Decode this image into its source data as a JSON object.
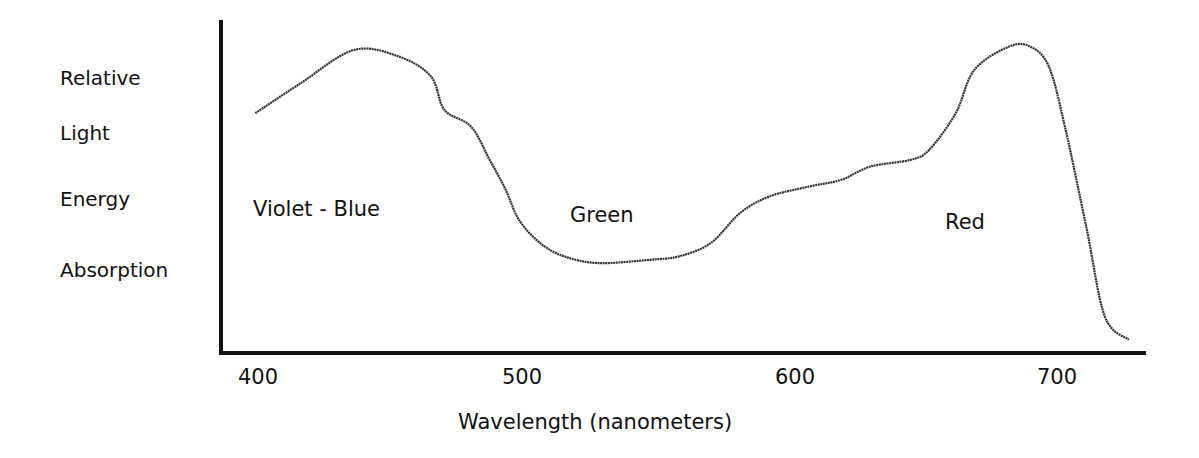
{
  "chart_data": {
    "type": "line",
    "title": "",
    "xlabel": "Wavelength (nanometers)",
    "ylabel_lines": [
      "Relative",
      "Light",
      "Energy",
      "Absorption"
    ],
    "ylabel": "Relative Light Energy Absorption",
    "xlim": [
      387,
      735
    ],
    "ylim": [
      0,
      100
    ],
    "x_ticks": [
      400,
      500,
      600,
      700
    ],
    "x_tick_labels": [
      "400",
      "500",
      "600",
      "700"
    ],
    "y_ticks": [],
    "grid": false,
    "legend": null,
    "annotations": [
      {
        "text": "Violet - Blue",
        "x": 400,
        "y": 42
      },
      {
        "text": "Green",
        "x": 525,
        "y": 40
      },
      {
        "text": "Red",
        "x": 665,
        "y": 37
      }
    ],
    "series": [
      {
        "name": "Relative Light Energy Absorption",
        "x": [
          399,
          416,
          436,
          453,
          465,
          470,
          480,
          487,
          493,
          498,
          506,
          515,
          528,
          547,
          558,
          570,
          581,
          592,
          607,
          619,
          630,
          645,
          652,
          662,
          669,
          682,
          690,
          697,
          703,
          711,
          718,
          727
        ],
        "values": [
          72,
          81,
          91,
          89,
          83,
          73,
          68,
          58,
          49,
          40,
          33,
          29,
          27,
          28,
          29,
          33,
          42,
          47,
          50,
          52,
          56,
          58,
          61,
          72,
          85,
          92,
          92,
          86,
          68,
          38,
          11,
          4
        ]
      }
    ]
  },
  "labels": {
    "y_lines": [
      "Relative",
      "Light",
      "Energy",
      "Absorption"
    ],
    "x_title": "Wavelength (nanometers)",
    "ticks": [
      "400",
      "500",
      "600",
      "700"
    ],
    "regions": [
      "Violet - Blue",
      "Green",
      "Red"
    ]
  },
  "colors": {
    "axis": "#111111",
    "curve": "#333333",
    "background": "#ffffff"
  }
}
